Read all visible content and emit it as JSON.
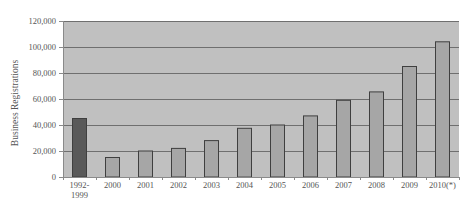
{
  "chart_data": {
    "type": "bar",
    "title": "",
    "xlabel": "",
    "ylabel": "Business Registrations",
    "ylim": [
      0,
      120000
    ],
    "yticks": [
      0,
      20000,
      40000,
      60000,
      80000,
      100000,
      120000
    ],
    "ytick_labels": [
      "0",
      "20,000",
      "40,000",
      "60,000",
      "80,000",
      "100,000",
      "120,000"
    ],
    "grid": true,
    "legend": null,
    "categories": [
      "1992-1999",
      "2000",
      "2001",
      "2002",
      "2003",
      "2004",
      "2005",
      "2006",
      "2007",
      "2008",
      "2009",
      "2010(*)"
    ],
    "category_labels": [
      [
        "1992-",
        "1999"
      ],
      [
        "2000"
      ],
      [
        "2001"
      ],
      [
        "2002"
      ],
      [
        "2003"
      ],
      [
        "2004"
      ],
      [
        "2005"
      ],
      [
        "2006"
      ],
      [
        "2007"
      ],
      [
        "2008"
      ],
      [
        "2009"
      ],
      [
        "2010(*)"
      ]
    ],
    "values": [
      45000,
      15000,
      20000,
      22000,
      28000,
      37500,
      40000,
      47000,
      59000,
      65500,
      85000,
      104000
    ],
    "colors": {
      "plot_background": "#c0c0c0",
      "gridline": "#6f6f6f",
      "bar_first": "#595959",
      "bar_default": "#a6a6a6",
      "bar_border": "#3f3f3f",
      "axis": "#8a8a8a"
    }
  }
}
